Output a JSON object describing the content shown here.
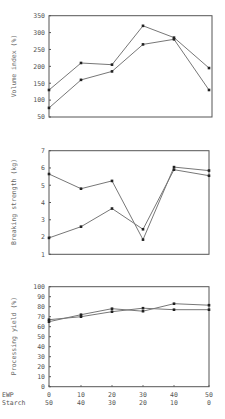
{
  "chart_data": [
    {
      "type": "line",
      "title": "",
      "ylabel": "Volume index (%)",
      "xlabel": "",
      "x": [
        0,
        10,
        20,
        30,
        40,
        50
      ],
      "ylim": [
        50,
        350
      ],
      "yticks": [
        50,
        100,
        150,
        200,
        250,
        300,
        350
      ],
      "grid": false,
      "series": [
        {
          "name": "Series A",
          "values": [
            130,
            210,
            205,
            320,
            285,
            195
          ]
        },
        {
          "name": "Series B",
          "values": [
            77,
            160,
            185,
            265,
            280,
            130
          ]
        }
      ]
    },
    {
      "type": "line",
      "title": "",
      "ylabel": "Breaking strength (kg)",
      "xlabel": "",
      "x": [
        0,
        10,
        20,
        30,
        40,
        50
      ],
      "ylim": [
        1,
        7
      ],
      "yticks": [
        1,
        2,
        3,
        4,
        5,
        6,
        7
      ],
      "grid": false,
      "series": [
        {
          "name": "Series A",
          "values": [
            5.65,
            4.8,
            5.25,
            1.85,
            6.05,
            5.85
          ]
        },
        {
          "name": "Series B",
          "values": [
            1.95,
            2.6,
            3.65,
            2.45,
            5.9,
            5.55
          ]
        }
      ]
    },
    {
      "type": "line",
      "title": "",
      "ylabel": "Processing yield (%)",
      "xlabel": "",
      "x": [
        0,
        10,
        20,
        30,
        40,
        50
      ],
      "ylim": [
        0,
        100
      ],
      "yticks": [
        0,
        10,
        20,
        30,
        40,
        50,
        60,
        70,
        80,
        90,
        100
      ],
      "grid": false,
      "series": [
        {
          "name": "Series A",
          "values": [
            65,
            72,
            78,
            75.5,
            83,
            81.5
          ]
        },
        {
          "name": "Series B",
          "values": [
            67,
            70,
            75,
            78.5,
            77,
            77
          ]
        }
      ]
    }
  ],
  "x_axis": {
    "rows": [
      {
        "label": "EWP",
        "values": [
          "0",
          "10",
          "20",
          "30",
          "40",
          "50"
        ]
      },
      {
        "label": "Starch",
        "values": [
          "50",
          "40",
          "30",
          "20",
          "10",
          "0"
        ]
      }
    ]
  }
}
